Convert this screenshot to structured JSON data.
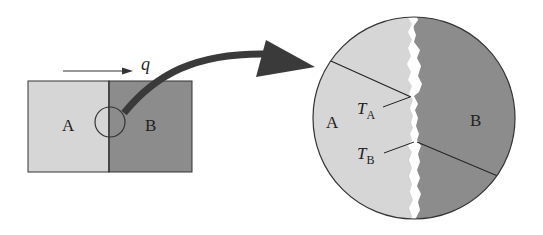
{
  "diagram": {
    "left_block": {
      "region_a_label": "A",
      "region_b_label": "B"
    },
    "heat_flow": {
      "label": "q"
    },
    "magnified_view": {
      "region_a_label": "A",
      "region_b_label": "B",
      "temp_a": {
        "symbol": "T",
        "subscript": "A"
      },
      "temp_b": {
        "symbol": "T",
        "subscript": "B"
      }
    },
    "colors": {
      "region_a": "#d6d6d6",
      "region_b": "#8c8c8c",
      "arrow": "#3a3a3a",
      "outline": "#333333",
      "gap": "#ffffff"
    }
  }
}
